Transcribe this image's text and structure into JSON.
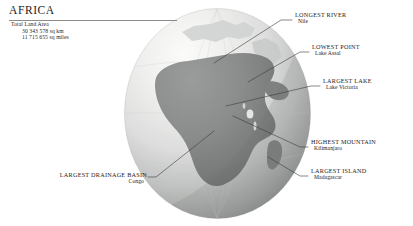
{
  "title": {
    "continent": "AFRICA"
  },
  "stats": {
    "label": "Total Land Area",
    "area_sq_km": "30 343 578 sq km",
    "area_sq_miles": "11 715 655 sq miles"
  },
  "callouts": [
    {
      "id": "longest-river",
      "head": "LONGEST RIVER",
      "sub": "Nile"
    },
    {
      "id": "lowest-point",
      "head": "LOWEST POINT",
      "sub": "Lake Assal"
    },
    {
      "id": "largest-lake",
      "head": "LARGEST LAKE",
      "sub": "Lake Victoria"
    },
    {
      "id": "highest-mountain",
      "head": "HIGHEST MOUNTAIN",
      "sub": "Kilimanjaro"
    },
    {
      "id": "largest-island",
      "head": "LARGEST ISLAND",
      "sub": "Madagascar"
    },
    {
      "id": "drainage-basin",
      "head": "LARGEST DRAINAGE BASIN",
      "sub": "Congo"
    }
  ],
  "globe": {
    "name": "africa-globe",
    "ocean_light": "#f4f4f3",
    "ocean_mid": "#d2d3d2",
    "ocean_dark": "#8e9090",
    "land": "#8a8c8b",
    "land_dark": "#6f7271",
    "leader_line_color": "#3a3a3a",
    "rule_color": "#8d8a88"
  }
}
